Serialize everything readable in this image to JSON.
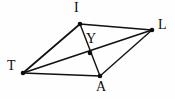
{
  "figure": {
    "kind": "geometry-diagram",
    "width": 175,
    "height": 99,
    "background_color": "#fefefe",
    "stroke_color": "#111111",
    "label_color": "#0d0d0d",
    "points": [
      {
        "id": "I",
        "label": "I",
        "x": 80,
        "y": 24,
        "label_x": 74,
        "label_y": 1
      },
      {
        "id": "L",
        "label": "L",
        "x": 152,
        "y": 30,
        "label_x": 158,
        "label_y": 18
      },
      {
        "id": "T",
        "label": "T",
        "x": 23,
        "y": 73,
        "label_x": 7,
        "label_y": 59
      },
      {
        "id": "A",
        "label": "A",
        "x": 100,
        "y": 76,
        "label_x": 96,
        "label_y": 80
      },
      {
        "id": "Y",
        "label": "Y",
        "x": 90,
        "y": 53,
        "label_x": 86,
        "label_y": 32
      }
    ],
    "segments": [
      {
        "id": "T-I",
        "from": "T",
        "to": "I",
        "style": "edge"
      },
      {
        "id": "I-L",
        "from": "I",
        "to": "L",
        "style": "edge"
      },
      {
        "id": "L-A",
        "from": "L",
        "to": "A",
        "style": "edge-thin"
      },
      {
        "id": "A-T",
        "from": "A",
        "to": "T",
        "style": "edge"
      },
      {
        "id": "I-A",
        "from": "I",
        "to": "A",
        "style": "edge-thin"
      },
      {
        "id": "T-L",
        "from": "T",
        "to": "L",
        "style": "edge"
      }
    ],
    "dot_radius": 2.3
  }
}
